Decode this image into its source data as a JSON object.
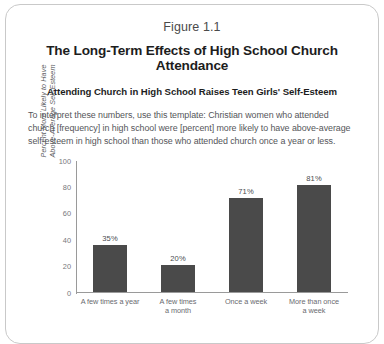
{
  "figure": {
    "number": "Figure 1.1",
    "title": "The Long-Term Effects of High School Church Attendance",
    "subtitle": "Attending Church in High School Raises Teen Girls' Self-Esteem",
    "body": "To interpret these numbers, use this template: Christian women who attended church [frequency] in high school were [percent] more likely to have above-average self-esteem in high school than those who attended church once a year or less.",
    "border_color": "#c9c9c9"
  },
  "chart_data": {
    "type": "bar",
    "title": "Attending Church in High School Raises Teen Girls' Self-Esteem",
    "categories": [
      "A few times a year",
      "A few times a month",
      "Once a week",
      "More than once a week"
    ],
    "category_lines": [
      [
        "A few times a year"
      ],
      [
        "A few times",
        "a month"
      ],
      [
        "Once a week"
      ],
      [
        "More than once",
        "a week"
      ]
    ],
    "values": [
      35,
      20,
      71,
      81
    ],
    "data_labels": [
      "35%",
      "20%",
      "71%",
      "81%"
    ],
    "xlabel": "",
    "ylabel": "Percent More Likely to Have Above-Average Self-Esteem",
    "ylabel_lines": [
      "Percent More Likely to Have",
      "Above-Average Self-Esteem"
    ],
    "ylim": [
      0,
      100
    ],
    "yticks": [
      100,
      80,
      60,
      40,
      20,
      0
    ],
    "grid": false,
    "legend": false,
    "bar_color": "#4a4a4a",
    "axis_color": "#9a9a9a"
  }
}
